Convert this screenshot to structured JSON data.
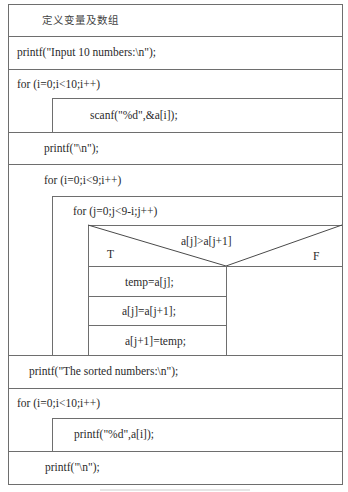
{
  "diagram": {
    "type": "nassi-shneiderman",
    "blocks": {
      "declare": "定义变量及数组",
      "print_input_prompt": "printf(\"Input 10 numbers:\\n\");",
      "loop1_header": "for (i=0;i<10;i++)",
      "loop1_body": "scanf(\"%d\",&a[i]);",
      "print_newline_1": "printf(\"\\n\");",
      "outer_loop_header": "for (i=0;i<9;i++)",
      "inner_loop_header": "for (j=0;j<9-i;j++)",
      "condition": "a[j]>a[j+1]",
      "true_label": "T",
      "false_label": "F",
      "swap_1": "temp=a[j];",
      "swap_2": "a[j]=a[j+1];",
      "swap_3": "a[j+1]=temp;",
      "print_sorted_prompt": "printf(\"The sorted numbers:\\n\");",
      "loop3_header": "for (i=0;i<10;i++)",
      "loop3_body": "printf(\"%d\",a[i]);",
      "print_newline_2": "printf(\"\\n\");"
    },
    "colors": {
      "line": "#6e6e6e",
      "text": "#2a2a2a",
      "background": "#ffffff"
    }
  }
}
